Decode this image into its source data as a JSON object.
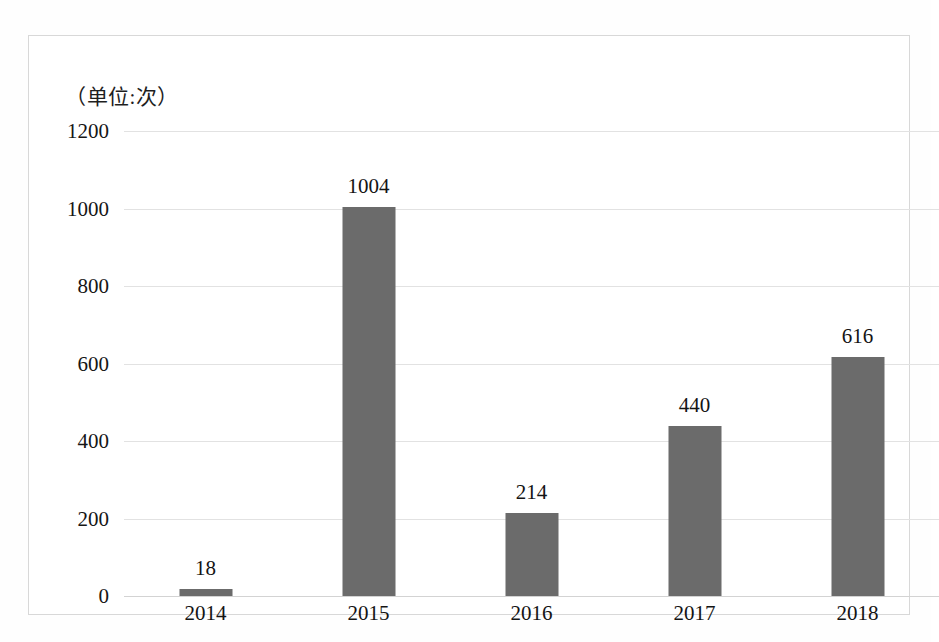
{
  "chart_data": {
    "type": "bar",
    "title": "（单位:次）",
    "xlabel": "",
    "ylabel": "",
    "categories": [
      "2014",
      "2015",
      "2016",
      "2017",
      "2018"
    ],
    "values": [
      18,
      1004,
      214,
      440,
      616
    ],
    "value_labels": [
      "18",
      "1004",
      "214",
      "440",
      "616"
    ],
    "ylim": [
      0,
      1200
    ],
    "yticks": [
      0,
      200,
      400,
      600,
      800,
      1000,
      1200
    ],
    "ytick_labels": [
      "0",
      "200",
      "400",
      "600",
      "800",
      "1000",
      "1200"
    ],
    "grid": true,
    "legend": false,
    "series": [
      {
        "name": "",
        "values": [
          18,
          1004,
          214,
          440,
          616
        ],
        "color": "#6b6b6b"
      }
    ],
    "colors": {
      "bar": "#6b6b6b",
      "gridline": "#e2e2e2",
      "axis": "#d3d3d3",
      "frame": "#d8d8d8",
      "background": "#ffffff",
      "text": "#141414"
    }
  }
}
